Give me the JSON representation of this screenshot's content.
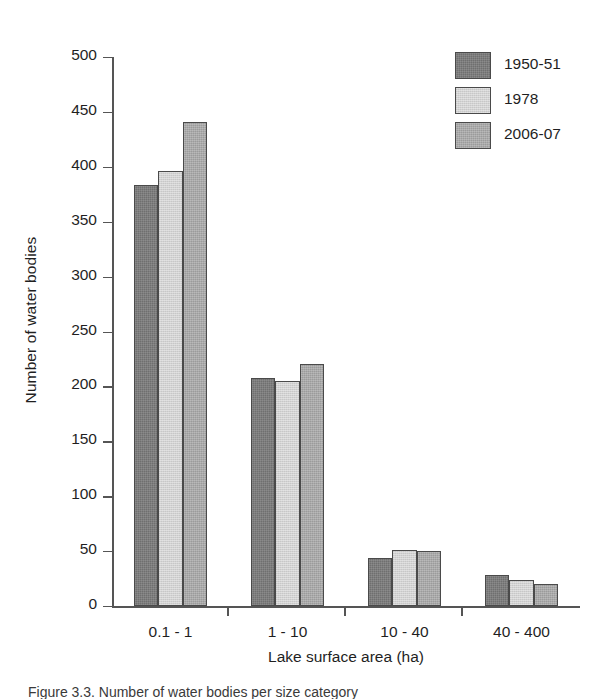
{
  "chart_data": {
    "type": "bar",
    "title": "",
    "xlabel": "Lake surface area (ha)",
    "ylabel": "Number of water bodies",
    "categories": [
      "0.1 - 1",
      "1 - 10",
      "10 - 40",
      "40 - 400"
    ],
    "series": [
      {
        "name": "1950-51",
        "color": "#6f6f6f",
        "values": [
          383,
          208,
          44,
          28
        ]
      },
      {
        "name": "1978",
        "color": "#d2d2d2",
        "values": [
          396,
          205,
          51,
          24
        ]
      },
      {
        "name": "2006-07",
        "color": "#9b9b9b",
        "values": [
          441,
          220,
          50,
          20
        ]
      }
    ],
    "ylim": [
      0,
      500
    ],
    "ytick_values": [
      0,
      50,
      100,
      150,
      200,
      250,
      300,
      350,
      400,
      450,
      500
    ],
    "ytick_labels": [
      "0",
      "50",
      "100",
      "150",
      "200",
      "250",
      "300",
      "350",
      "400",
      "450",
      "500"
    ],
    "grid": false,
    "legend_position": "top-right"
  },
  "caption": {
    "clipped_text": "Figure 3.3. Number of water bodies per size category"
  }
}
